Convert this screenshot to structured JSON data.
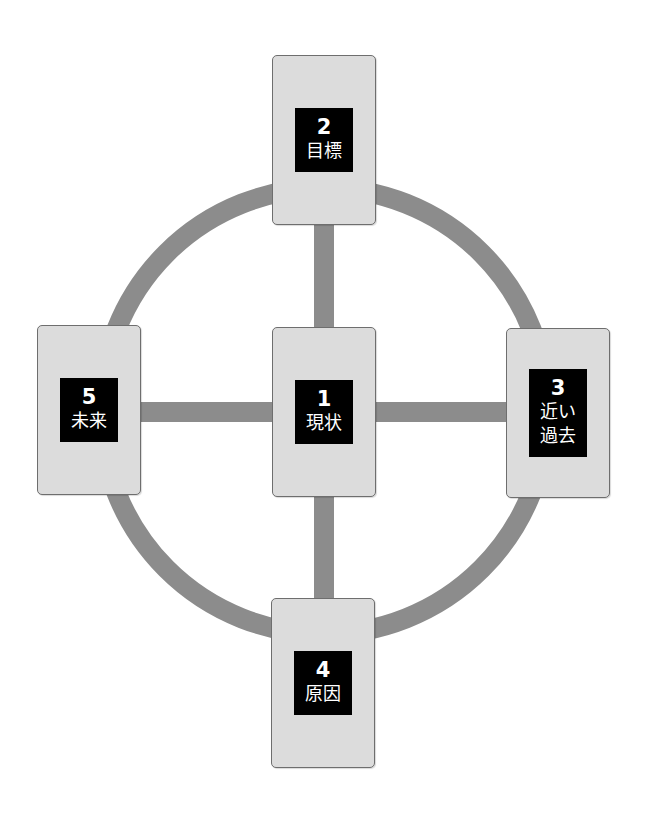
{
  "diagram": {
    "title": "",
    "ring_color": "#8c8c8c",
    "card_color": "#dcdcdc",
    "label_bg": "#000000",
    "cards": [
      {
        "position": "center",
        "number": "1",
        "label": "現状"
      },
      {
        "position": "top",
        "number": "2",
        "label": "目標"
      },
      {
        "position": "right",
        "number": "3",
        "label": "近い\n過去"
      },
      {
        "position": "bottom",
        "number": "4",
        "label": "原因"
      },
      {
        "position": "left",
        "number": "5",
        "label": "未来"
      }
    ]
  }
}
